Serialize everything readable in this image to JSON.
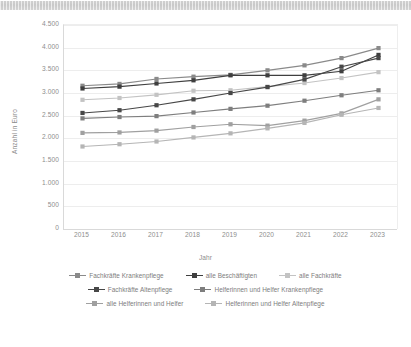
{
  "chart_data": {
    "type": "line",
    "title": "",
    "xlabel": "Jahr",
    "ylabel": "Anzahl in Euro",
    "grid": true,
    "legend_position": "bottom",
    "ylim": [
      0,
      4500
    ],
    "ytick_labels": [
      "4.500",
      "4.000",
      "3.500",
      "3.000",
      "2.500",
      "2.000",
      "1.500",
      "1.000",
      "500",
      "0"
    ],
    "ytick_values": [
      4500,
      4000,
      3500,
      3000,
      2500,
      2000,
      1500,
      1000,
      500,
      0
    ],
    "categories": [
      "2015",
      "2016",
      "2017",
      "2018",
      "2019",
      "2020",
      "2021",
      "2022",
      "2023"
    ],
    "x": [
      2015,
      2016,
      2017,
      2018,
      2019,
      2020,
      2021,
      2022,
      2023
    ],
    "series": [
      {
        "name": "Fachkräfte Krankenpflege",
        "color": "#8a8a8a",
        "values": [
          3160,
          3200,
          3310,
          3360,
          3400,
          3500,
          3610,
          3770,
          3990
        ]
      },
      {
        "name": "alle Beschäftigten",
        "color": "#3f3f3f",
        "values": [
          3100,
          3140,
          3210,
          3280,
          3390,
          3390,
          3390,
          3480,
          3840
        ]
      },
      {
        "name": "alle Fachkräfte",
        "color": "#c3c3c3",
        "values": [
          2850,
          2890,
          2960,
          3050,
          3060,
          3140,
          3220,
          3330,
          3460
        ]
      },
      {
        "name": "Fachkräfte Altenpflege",
        "color": "#474747",
        "values": [
          2560,
          2620,
          2730,
          2860,
          3000,
          3130,
          3300,
          3580,
          3770
        ]
      },
      {
        "name": "Helferinnen und Helfer Krankenpflege",
        "color": "#7e7e7e",
        "values": [
          2440,
          2470,
          2490,
          2570,
          2650,
          2720,
          2830,
          2950,
          3060
        ]
      },
      {
        "name": "alle Helferinnen und Helfer",
        "color": "#a0a0a0",
        "values": [
          2120,
          2130,
          2170,
          2250,
          2310,
          2280,
          2390,
          2550,
          2860
        ]
      },
      {
        "name": "Helferinnen und Helfer Altenpflege",
        "color": "#b5b5b5",
        "values": [
          1820,
          1870,
          1930,
          2020,
          2110,
          2220,
          2340,
          2520,
          2670
        ]
      }
    ]
  },
  "legend": {
    "rows": [
      [
        "Fachkräfte Krankenpflege",
        "alle Beschäftigten",
        "alle Fachkräfte"
      ],
      [
        "Fachkräfte Altenpflege",
        "Helferinnen und Helfer Krankenpflege"
      ],
      [
        "alle Helferinnen und Helfer",
        "Helferinnen und Helfer Altenpflege"
      ]
    ]
  }
}
